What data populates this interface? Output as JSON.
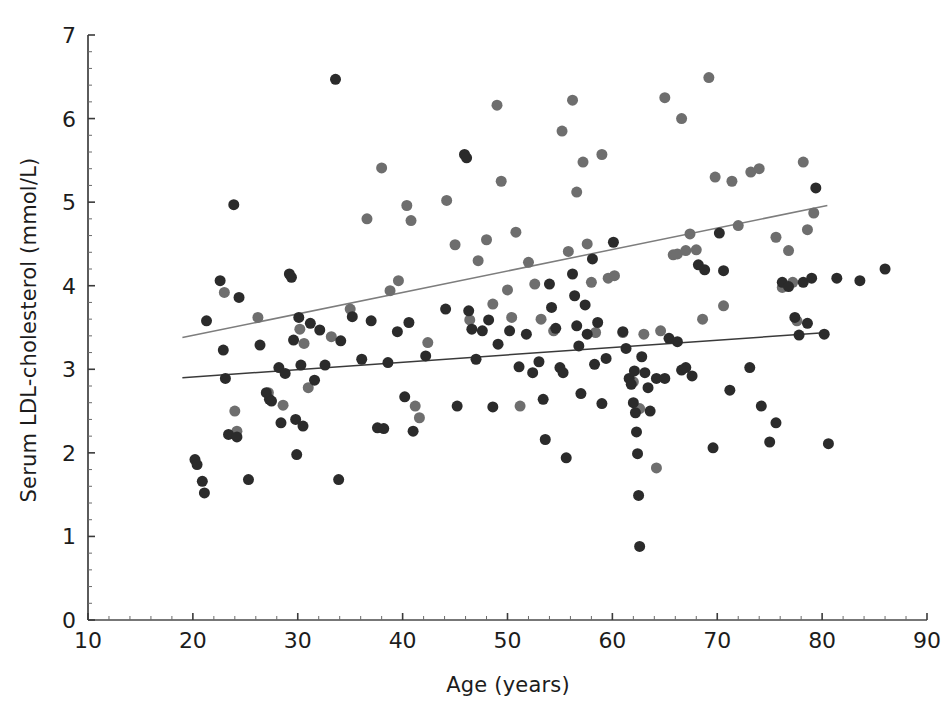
{
  "chart_data": {
    "type": "scatter",
    "title": "",
    "xlabel": "Age (years)",
    "ylabel": "Serum LDL-cholesterol (mmol/L)",
    "xlim": [
      10,
      90
    ],
    "ylim": [
      0,
      7
    ],
    "xticks": [
      10,
      20,
      30,
      40,
      50,
      60,
      70,
      80,
      90
    ],
    "yticks": [
      0,
      1,
      2,
      3,
      4,
      5,
      6,
      7
    ],
    "xtick_labels": [
      "10",
      "20",
      "30",
      "40",
      "50",
      "60",
      "70",
      "80",
      "90"
    ],
    "ytick_labels": [
      "0",
      "1",
      "2",
      "3",
      "4",
      "5",
      "6",
      "7"
    ],
    "grid": false,
    "legend": "none",
    "minor_ticks": true,
    "series": [
      {
        "name": "dark-group",
        "color": "#2b2b2b",
        "marker": "circle",
        "marker_size": 11,
        "points": [
          [
            20.2,
            1.92
          ],
          [
            20.4,
            1.86
          ],
          [
            20.9,
            1.66
          ],
          [
            21.1,
            1.52
          ],
          [
            21.3,
            3.58
          ],
          [
            22.6,
            4.06
          ],
          [
            22.9,
            3.23
          ],
          [
            23.1,
            2.89
          ],
          [
            23.4,
            2.22
          ],
          [
            23.9,
            4.97
          ],
          [
            24.2,
            2.19
          ],
          [
            24.4,
            3.86
          ],
          [
            25.3,
            1.68
          ],
          [
            26.4,
            3.29
          ],
          [
            27.0,
            2.72
          ],
          [
            27.3,
            2.64
          ],
          [
            27.5,
            2.62
          ],
          [
            28.2,
            3.02
          ],
          [
            28.4,
            2.36
          ],
          [
            28.8,
            2.95
          ],
          [
            29.2,
            4.14
          ],
          [
            29.4,
            4.1
          ],
          [
            29.6,
            3.35
          ],
          [
            29.8,
            2.4
          ],
          [
            29.9,
            1.98
          ],
          [
            30.1,
            3.62
          ],
          [
            30.3,
            3.05
          ],
          [
            30.5,
            2.32
          ],
          [
            31.2,
            3.55
          ],
          [
            31.6,
            2.87
          ],
          [
            32.1,
            3.47
          ],
          [
            32.6,
            3.05
          ],
          [
            33.6,
            6.47
          ],
          [
            33.9,
            1.68
          ],
          [
            34.1,
            3.34
          ],
          [
            35.2,
            3.63
          ],
          [
            36.1,
            3.12
          ],
          [
            37.0,
            3.58
          ],
          [
            37.6,
            2.3
          ],
          [
            38.2,
            2.29
          ],
          [
            38.6,
            3.08
          ],
          [
            39.5,
            3.45
          ],
          [
            40.2,
            2.67
          ],
          [
            40.6,
            3.56
          ],
          [
            41.0,
            2.26
          ],
          [
            42.2,
            3.16
          ],
          [
            44.1,
            3.72
          ],
          [
            45.2,
            2.56
          ],
          [
            45.9,
            5.57
          ],
          [
            46.1,
            5.53
          ],
          [
            46.3,
            3.7
          ],
          [
            46.6,
            3.48
          ],
          [
            47.0,
            3.12
          ],
          [
            47.6,
            3.46
          ],
          [
            48.2,
            3.59
          ],
          [
            48.6,
            2.55
          ],
          [
            49.1,
            3.3
          ],
          [
            50.2,
            3.46
          ],
          [
            51.1,
            3.03
          ],
          [
            51.8,
            3.42
          ],
          [
            52.4,
            2.96
          ],
          [
            53.0,
            3.09
          ],
          [
            53.4,
            2.64
          ],
          [
            53.6,
            2.16
          ],
          [
            54.0,
            4.02
          ],
          [
            54.2,
            3.74
          ],
          [
            54.6,
            3.49
          ],
          [
            55.0,
            3.02
          ],
          [
            55.3,
            2.96
          ],
          [
            55.6,
            1.94
          ],
          [
            56.2,
            4.14
          ],
          [
            56.4,
            3.88
          ],
          [
            56.6,
            3.52
          ],
          [
            56.8,
            3.28
          ],
          [
            57.0,
            2.71
          ],
          [
            57.4,
            3.77
          ],
          [
            57.6,
            3.42
          ],
          [
            58.1,
            4.32
          ],
          [
            58.3,
            3.06
          ],
          [
            58.6,
            3.56
          ],
          [
            59.0,
            2.59
          ],
          [
            59.4,
            3.13
          ],
          [
            60.1,
            4.52
          ],
          [
            61.0,
            3.45
          ],
          [
            61.3,
            3.25
          ],
          [
            61.6,
            2.89
          ],
          [
            61.8,
            2.82
          ],
          [
            62.0,
            2.6
          ],
          [
            62.1,
            2.98
          ],
          [
            62.2,
            2.48
          ],
          [
            62.3,
            2.25
          ],
          [
            62.4,
            1.99
          ],
          [
            62.5,
            1.49
          ],
          [
            62.6,
            0.88
          ],
          [
            62.8,
            3.15
          ],
          [
            63.1,
            2.96
          ],
          [
            63.4,
            2.78
          ],
          [
            63.6,
            2.5
          ],
          [
            64.2,
            2.89
          ],
          [
            65.0,
            2.89
          ],
          [
            65.4,
            3.37
          ],
          [
            66.2,
            3.33
          ],
          [
            66.6,
            2.99
          ],
          [
            67.0,
            3.02
          ],
          [
            67.6,
            2.92
          ],
          [
            68.2,
            4.25
          ],
          [
            68.8,
            4.19
          ],
          [
            69.6,
            2.06
          ],
          [
            70.2,
            4.63
          ],
          [
            70.6,
            4.18
          ],
          [
            71.2,
            2.75
          ],
          [
            73.1,
            3.02
          ],
          [
            74.2,
            2.56
          ],
          [
            75.0,
            2.13
          ],
          [
            75.6,
            2.36
          ],
          [
            76.2,
            4.04
          ],
          [
            76.8,
            3.99
          ],
          [
            77.4,
            3.62
          ],
          [
            77.8,
            3.41
          ],
          [
            78.2,
            4.04
          ],
          [
            78.6,
            3.55
          ],
          [
            79.0,
            4.09
          ],
          [
            79.4,
            5.17
          ],
          [
            80.2,
            3.42
          ],
          [
            80.6,
            2.11
          ],
          [
            81.4,
            4.09
          ],
          [
            83.6,
            4.06
          ],
          [
            86.0,
            4.2
          ]
        ]
      },
      {
        "name": "gray-group",
        "color": "#6e6e6e",
        "marker": "circle",
        "marker_size": 11,
        "points": [
          [
            23.0,
            3.92
          ],
          [
            24.0,
            2.5
          ],
          [
            24.2,
            2.26
          ],
          [
            26.2,
            3.62
          ],
          [
            27.2,
            2.72
          ],
          [
            28.6,
            2.57
          ],
          [
            30.2,
            3.48
          ],
          [
            30.6,
            3.31
          ],
          [
            31.0,
            2.78
          ],
          [
            33.2,
            3.39
          ],
          [
            35.0,
            3.72
          ],
          [
            36.6,
            4.8
          ],
          [
            38.0,
            5.41
          ],
          [
            38.8,
            3.94
          ],
          [
            39.6,
            4.06
          ],
          [
            40.4,
            4.96
          ],
          [
            40.8,
            4.78
          ],
          [
            41.2,
            2.56
          ],
          [
            41.6,
            2.42
          ],
          [
            42.4,
            3.32
          ],
          [
            44.2,
            5.02
          ],
          [
            45.0,
            4.49
          ],
          [
            46.4,
            3.59
          ],
          [
            47.2,
            4.3
          ],
          [
            48.0,
            4.55
          ],
          [
            48.6,
            3.78
          ],
          [
            49.0,
            6.16
          ],
          [
            49.4,
            5.25
          ],
          [
            50.0,
            3.95
          ],
          [
            50.4,
            3.62
          ],
          [
            50.8,
            4.64
          ],
          [
            51.2,
            2.56
          ],
          [
            52.0,
            4.28
          ],
          [
            52.6,
            4.02
          ],
          [
            53.2,
            3.6
          ],
          [
            54.4,
            3.46
          ],
          [
            55.2,
            5.85
          ],
          [
            55.8,
            4.41
          ],
          [
            56.2,
            6.22
          ],
          [
            56.6,
            5.12
          ],
          [
            57.2,
            5.48
          ],
          [
            57.6,
            4.5
          ],
          [
            58.0,
            4.04
          ],
          [
            58.4,
            3.44
          ],
          [
            59.0,
            5.57
          ],
          [
            59.6,
            4.09
          ],
          [
            60.2,
            4.12
          ],
          [
            61.0,
            3.44
          ],
          [
            62.0,
            2.85
          ],
          [
            62.6,
            2.53
          ],
          [
            63.0,
            3.42
          ],
          [
            64.2,
            1.82
          ],
          [
            64.6,
            3.46
          ],
          [
            65.0,
            6.25
          ],
          [
            65.8,
            4.37
          ],
          [
            66.2,
            4.38
          ],
          [
            66.6,
            6.0
          ],
          [
            67.0,
            4.42
          ],
          [
            67.4,
            4.62
          ],
          [
            68.0,
            4.43
          ],
          [
            68.6,
            3.6
          ],
          [
            69.2,
            6.49
          ],
          [
            69.8,
            5.3
          ],
          [
            70.6,
            3.76
          ],
          [
            71.4,
            5.25
          ],
          [
            72.0,
            4.72
          ],
          [
            73.2,
            5.36
          ],
          [
            74.0,
            5.4
          ],
          [
            75.6,
            4.58
          ],
          [
            76.2,
            3.98
          ],
          [
            76.8,
            4.42
          ],
          [
            77.2,
            4.04
          ],
          [
            77.6,
            3.58
          ],
          [
            78.2,
            5.48
          ],
          [
            78.6,
            4.67
          ],
          [
            79.2,
            4.87
          ]
        ]
      }
    ],
    "trend_lines": [
      {
        "name": "gray-trend",
        "color": "#7d7d7d",
        "x": [
          19.0,
          80.5
        ],
        "y": [
          3.38,
          4.96
        ]
      },
      {
        "name": "dark-trend",
        "color": "#3a3a3a",
        "x": [
          19.0,
          80.5
        ],
        "y": [
          2.9,
          3.44
        ]
      }
    ]
  },
  "axes": {
    "x_title": "Age (years)",
    "y_title": "Serum LDL-cholesterol (mmol/L)"
  }
}
